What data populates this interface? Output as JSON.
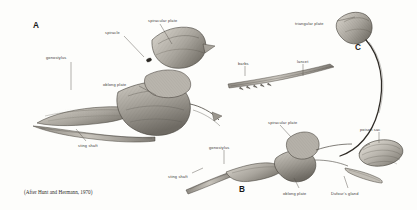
{
  "figure": {
    "kind": "scientific-illustration",
    "background_color": "#fdfdfb",
    "ink_color": "#3a3a38",
    "credit": "(After Hunt and Hermann, 1970)"
  },
  "panels": [
    {
      "id": "A",
      "letter": "A",
      "x": 33,
      "y": 22
    },
    {
      "id": "B",
      "letter": "B",
      "x": 239,
      "y": 186
    },
    {
      "id": "C",
      "letter": "C",
      "x": 355,
      "y": 44
    }
  ],
  "labels": [
    {
      "id": "a-gonostylus",
      "text": "gonostylus",
      "panel": "A",
      "x": 46,
      "y": 56,
      "anchor": "start",
      "leader": {
        "x1": 71,
        "y1": 62,
        "x2": 71,
        "y2": 90
      }
    },
    {
      "id": "a-spiracle",
      "text": "spiracle",
      "panel": "A",
      "x": 105,
      "y": 31,
      "anchor": "start",
      "leader": {
        "x1": 124,
        "y1": 36,
        "x2": 144,
        "y2": 57
      }
    },
    {
      "id": "a-spiracular-plate",
      "text": "spiracular plate",
      "panel": "A",
      "x": 148,
      "y": 19,
      "anchor": "start",
      "leader": {
        "x1": 160,
        "y1": 24,
        "x2": 172,
        "y2": 44
      }
    },
    {
      "id": "a-oblong-plate",
      "text": "oblong plate",
      "panel": "A",
      "x": 103,
      "y": 83,
      "anchor": "start",
      "leader": {
        "x1": 139,
        "y1": 86,
        "x2": 156,
        "y2": 95
      }
    },
    {
      "id": "a-sting-shaft",
      "text": "sting shaft",
      "panel": "A",
      "x": 78,
      "y": 144,
      "anchor": "start",
      "leader": {
        "x1": 86,
        "y1": 141,
        "x2": 76,
        "y2": 129
      }
    },
    {
      "id": "c-triangular-plate",
      "text": "triangular plate",
      "panel": "C",
      "x": 295,
      "y": 22,
      "anchor": "start",
      "leader": {
        "x1": 337,
        "y1": 21,
        "x2": 355,
        "y2": 17
      }
    },
    {
      "id": "c-barbs",
      "text": "barbs",
      "panel": "C",
      "x": 238,
      "y": 62,
      "anchor": "start",
      "leader": {
        "x1": 245,
        "y1": 66,
        "x2": 245,
        "y2": 76
      }
    },
    {
      "id": "c-lancet",
      "text": "lancet",
      "panel": "C",
      "x": 297,
      "y": 60,
      "anchor": "start",
      "leader": {
        "x1": 303,
        "y1": 64,
        "x2": 303,
        "y2": 76
      }
    },
    {
      "id": "b-spiracular-plate",
      "text": "spiracular plate",
      "panel": "B",
      "x": 268,
      "y": 121,
      "anchor": "start",
      "leader": {
        "x1": 280,
        "y1": 125,
        "x2": 291,
        "y2": 137
      }
    },
    {
      "id": "b-gonostylus",
      "text": "gonostylus",
      "panel": "B",
      "x": 209,
      "y": 146,
      "anchor": "start",
      "leader": {
        "x1": 224,
        "y1": 150,
        "x2": 224,
        "y2": 164
      }
    },
    {
      "id": "b-sting-shaft",
      "text": "sting shaft",
      "panel": "B",
      "x": 168,
      "y": 175,
      "anchor": "start",
      "leader": {
        "x1": 192,
        "y1": 173,
        "x2": 203,
        "y2": 168
      }
    },
    {
      "id": "b-oblong-plate",
      "text": "oblong plate",
      "panel": "B",
      "x": 283,
      "y": 192,
      "anchor": "start",
      "leader": {
        "x1": 299,
        "y1": 188,
        "x2": 294,
        "y2": 178
      }
    },
    {
      "id": "b-dufours-gland",
      "text": "Dufour's gland",
      "panel": "B",
      "x": 331,
      "y": 192,
      "anchor": "start",
      "leader": {
        "x1": 348,
        "y1": 188,
        "x2": 344,
        "y2": 176
      }
    },
    {
      "id": "b-poison-sac",
      "text": "poison sac",
      "panel": "B",
      "x": 360,
      "y": 128,
      "anchor": "start",
      "leader": {
        "x1": 379,
        "y1": 132,
        "x2": 379,
        "y2": 143
      }
    }
  ]
}
